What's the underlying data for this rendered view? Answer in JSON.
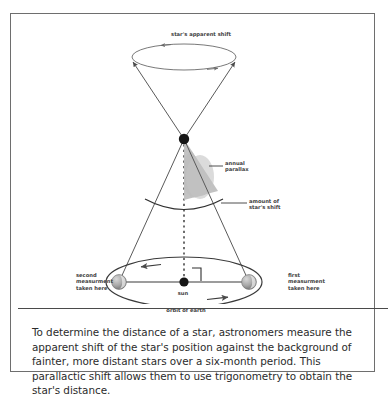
{
  "figure": {
    "colors": {
      "frame": "#6e6e6e",
      "line": "#4a4a4a",
      "ray": "#5a5a5a",
      "ellipse": "#5a5a5a",
      "star": "#161616",
      "sun": "#161616",
      "earth": "#9a9a9a",
      "parallax_wedge": "#b9b9b9",
      "text": "#3d3d3d",
      "caption_text": "#2b2b2b"
    }
  },
  "diagram": {
    "labels": {
      "apparent_shift": "star's apparent shift",
      "annual_parallax": "annual\nparallax",
      "amount_of_shift": "amount of\nstar's shift",
      "second_measurement": "second\nmeasurment\ntaken here",
      "first_measurement": "first\nmeasurment\ntaken here",
      "sun": "sun",
      "orbit_of_earth": "orbit of earth"
    },
    "objects": {
      "star": "star-point",
      "sun_body": "sun-point",
      "earth_left": "earth-sphere-second-position",
      "earth_right": "earth-sphere-first-position",
      "apparent_shift_ellipse": "apparent-shift-ellipse",
      "orbit_ellipse": "earth-orbit-ellipse",
      "parallax_wedge": "annual-parallax-wedge",
      "shift_arc": "star-shift-arc",
      "axis": "dotted-axis-line",
      "right_angle": "right-angle-marker"
    }
  },
  "caption": {
    "text": "To determine the distance of a star, astronomers measure the apparent shift of the star's position against the background of fainter, more distant stars over a six-month period. This parallactic shift allows them to use trigonometry to obtain the star's distance."
  }
}
